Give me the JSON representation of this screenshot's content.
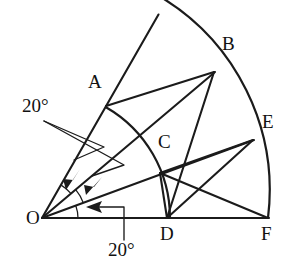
{
  "figure": {
    "type": "geometry-diagram",
    "stroke_color": "#1b1b1b",
    "background_color": "#ffffff",
    "points": [
      {
        "id": "O",
        "label": "O",
        "x": 42,
        "y": 218,
        "label_x": 26,
        "label_y": 219
      },
      {
        "id": "A",
        "label": "A",
        "x": 106,
        "y": 106,
        "label_x": 88,
        "label_y": 83
      },
      {
        "id": "B",
        "label": "B",
        "x": 214,
        "y": 72,
        "label_x": 222,
        "label_y": 45
      },
      {
        "id": "C",
        "label": "C",
        "x": 160,
        "y": 173,
        "label_x": 158,
        "label_y": 143
      },
      {
        "id": "D",
        "label": "D",
        "x": 167,
        "y": 217,
        "label_x": 160,
        "label_y": 226
      },
      {
        "id": "E",
        "label": "E",
        "x": 253,
        "y": 140,
        "label_x": 262,
        "label_y": 122
      },
      {
        "id": "F",
        "label": "F",
        "x": 268,
        "y": 217,
        "label_x": 261,
        "label_y": 226
      }
    ],
    "angles": [
      {
        "id": "angle-AOB",
        "value": "20°",
        "between": [
          "OA",
          "OB"
        ]
      },
      {
        "id": "angle-BOE",
        "value": "20°",
        "between": [
          "OB",
          "OE"
        ]
      },
      {
        "id": "angle-EOF",
        "value": "20°",
        "between": [
          "OE",
          "OF"
        ]
      }
    ],
    "angle_labels": [
      {
        "id": "upper-20",
        "text": "20°",
        "x": 22,
        "y": 106
      },
      {
        "id": "lower-20",
        "text": "20°",
        "x": 110,
        "y": 248
      }
    ],
    "segments": [
      {
        "id": "OF",
        "from": "O",
        "to": "F"
      },
      {
        "id": "OA-apex",
        "from": "O",
        "to": "apex"
      },
      {
        "id": "OB",
        "from": "O",
        "to": "B"
      },
      {
        "id": "OE",
        "from": "O",
        "to": "E"
      },
      {
        "id": "AB",
        "from": "A",
        "to": "B"
      },
      {
        "id": "BD",
        "from": "B",
        "to": "D"
      },
      {
        "id": "CE",
        "from": "C",
        "to": "E"
      },
      {
        "id": "DE",
        "from": "D",
        "to": "E"
      },
      {
        "id": "CD",
        "from": "C",
        "to": "D"
      },
      {
        "id": "CF",
        "from": "C",
        "to": "F"
      }
    ],
    "arcs": [
      {
        "id": "outer-arc",
        "center": "O",
        "radius": 226,
        "from": "apex",
        "to": "F"
      },
      {
        "id": "inner-arc",
        "center": "O",
        "radius": 128,
        "from": "A",
        "to": "D"
      }
    ]
  }
}
